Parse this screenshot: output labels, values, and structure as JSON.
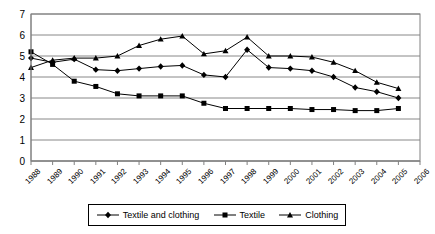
{
  "chart_data": {
    "type": "line",
    "title": "",
    "xlabel": "",
    "ylabel": "",
    "xlim": [
      1988,
      2006
    ],
    "ylim": [
      0,
      7
    ],
    "ytick_step": 1,
    "grid": true,
    "legend_position": "bottom",
    "categories": [
      "1988",
      "1989",
      "1990",
      "1991",
      "1992",
      "1993",
      "1994",
      "1995",
      "1996",
      "1997",
      "1998",
      "1999",
      "2000",
      "2001",
      "2002",
      "2003",
      "2004",
      "2005",
      "2006"
    ],
    "yticks": [
      "0",
      "1",
      "2",
      "3",
      "4",
      "5",
      "6",
      "7"
    ],
    "series": [
      {
        "name": "Textile and clothing",
        "marker": "diamond",
        "color": "#000000",
        "x": [
          1988,
          1989,
          1990,
          1991,
          1992,
          1993,
          1994,
          1995,
          1996,
          1997,
          1998,
          1999,
          2000,
          2001,
          2002,
          2003,
          2004,
          2005
        ],
        "values": [
          4.9,
          4.7,
          4.85,
          4.35,
          4.3,
          4.4,
          4.5,
          4.55,
          4.1,
          4.0,
          5.3,
          4.45,
          4.4,
          4.3,
          4.0,
          3.5,
          3.3,
          3.0
        ]
      },
      {
        "name": "Textile",
        "marker": "square",
        "color": "#000000",
        "x": [
          1988,
          1989,
          1990,
          1991,
          1992,
          1993,
          1994,
          1995,
          1996,
          1997,
          1998,
          1999,
          2000,
          2001,
          2002,
          2003,
          2004,
          2005
        ],
        "values": [
          5.2,
          4.6,
          3.8,
          3.55,
          3.2,
          3.1,
          3.1,
          3.1,
          2.75,
          2.5,
          2.5,
          2.5,
          2.5,
          2.45,
          2.45,
          2.4,
          2.4,
          2.5
        ]
      },
      {
        "name": "Clothing",
        "marker": "triangle",
        "color": "#000000",
        "x": [
          1988,
          1989,
          1990,
          1991,
          1992,
          1993,
          1994,
          1995,
          1996,
          1997,
          1998,
          1999,
          2000,
          2001,
          2002,
          2003,
          2004,
          2005
        ],
        "values": [
          4.45,
          4.8,
          4.9,
          4.9,
          5.0,
          5.5,
          5.8,
          5.95,
          5.1,
          5.25,
          5.9,
          5.0,
          5.0,
          4.95,
          4.7,
          4.3,
          3.75,
          3.45
        ]
      }
    ]
  },
  "legend": {
    "items": [
      {
        "label": "Textile and clothing",
        "marker": "diamond"
      },
      {
        "label": "Textile",
        "marker": "square"
      },
      {
        "label": "Clothing",
        "marker": "triangle"
      }
    ]
  }
}
